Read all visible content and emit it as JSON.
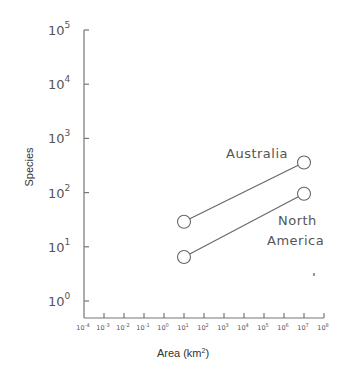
{
  "chart_data": {
    "type": "scatter",
    "title": "",
    "xlabel": "Area (km²)",
    "xlabel_base": "Area (km",
    "xlabel_sup": "2",
    "xlabel_tail": ")",
    "ylabel": "Species",
    "xscale": "log",
    "yscale": "log",
    "xlim": [
      0.0001,
      100000000
    ],
    "ylim": [
      1,
      100000
    ],
    "x_ticks": [
      {
        "exp": "-4",
        "value": 0.0001
      },
      {
        "exp": "-3",
        "value": 0.001
      },
      {
        "exp": "-2",
        "value": 0.01
      },
      {
        "exp": "-1",
        "value": 0.1
      },
      {
        "exp": "0",
        "value": 1
      },
      {
        "exp": "1",
        "value": 10
      },
      {
        "exp": "2",
        "value": 100
      },
      {
        "exp": "3",
        "value": 1000
      },
      {
        "exp": "4",
        "value": 10000
      },
      {
        "exp": "5",
        "value": 100000
      },
      {
        "exp": "6",
        "value": 1000000
      },
      {
        "exp": "7",
        "value": 10000000
      },
      {
        "exp": "8",
        "value": 100000000
      }
    ],
    "y_ticks": [
      {
        "exp": "0",
        "value": 1
      },
      {
        "exp": "1",
        "value": 10
      },
      {
        "exp": "2",
        "value": 100
      },
      {
        "exp": "3",
        "value": 1000
      },
      {
        "exp": "4",
        "value": 10000
      },
      {
        "exp": "5",
        "value": 100000
      }
    ],
    "tick_base": "10",
    "grid": false,
    "legend": "none (direct labels)",
    "series": [
      {
        "name": "Australia",
        "x": [
          10,
          10000000
        ],
        "y": [
          29,
          360
        ],
        "marker": "open-circle",
        "connected": true
      },
      {
        "name": "North America",
        "x": [
          10,
          10000000
        ],
        "y": [
          6.5,
          95
        ],
        "marker": "open-circle",
        "connected": true
      }
    ],
    "annotations": [
      {
        "text": "Australia",
        "series": "Australia"
      },
      {
        "text": "North",
        "series": "North America"
      },
      {
        "text": "America",
        "series": "North America"
      }
    ]
  }
}
